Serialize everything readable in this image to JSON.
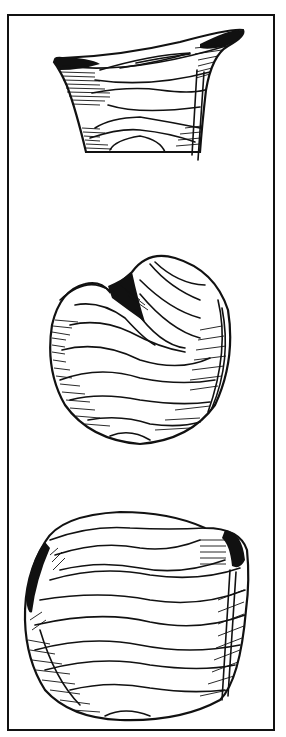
{
  "figure": {
    "items": [
      {
        "id": "vessel-top",
        "shape": "flared truncated cone bowl"
      },
      {
        "id": "vessel-middle",
        "shape": "spherical form with indented top"
      },
      {
        "id": "vessel-bottom",
        "shape": "rounded squarish bowl with curled rim"
      }
    ]
  },
  "colors": {
    "ink": "#111111",
    "paper": "#ffffff"
  }
}
